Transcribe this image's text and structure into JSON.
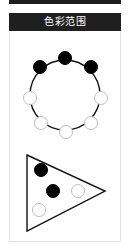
{
  "header": {
    "title": "色彩范围"
  },
  "colors": {
    "header_bg": "#1f1f1f",
    "header_text": "#ffffff",
    "card_border": "#e2e2e2",
    "node_filled": "#000000",
    "node_empty_fill": "#ffffff",
    "node_empty_stroke": "#bdbdbd",
    "line": "#111111"
  },
  "ring": {
    "center": [
      65,
      95
    ],
    "radius": 35,
    "nodes": [
      {
        "x": 65,
        "y": 58,
        "filled": true
      },
      {
        "x": 91,
        "y": 67,
        "filled": true
      },
      {
        "x": 101,
        "y": 98,
        "filled": false
      },
      {
        "x": 91,
        "y": 123,
        "filled": false
      },
      {
        "x": 66,
        "y": 132,
        "filled": false
      },
      {
        "x": 41,
        "y": 123,
        "filled": false
      },
      {
        "x": 30,
        "y": 98,
        "filled": false
      },
      {
        "x": 40,
        "y": 67,
        "filled": true
      }
    ]
  },
  "triangle": {
    "vertices": [
      [
        27,
        155
      ],
      [
        105,
        191
      ],
      [
        27,
        231
      ]
    ],
    "circles": [
      {
        "x": 41,
        "y": 170,
        "filled": true
      },
      {
        "x": 53,
        "y": 191,
        "filled": true
      },
      {
        "x": 78,
        "y": 191,
        "filled": false
      },
      {
        "x": 39,
        "y": 210,
        "filled": false
      }
    ]
  }
}
